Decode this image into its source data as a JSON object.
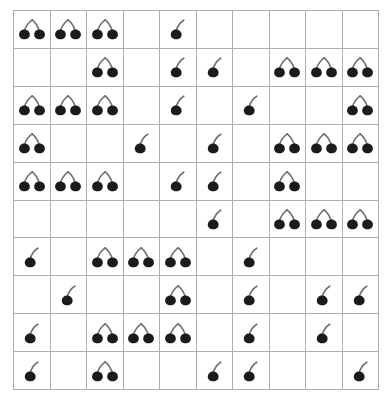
{
  "panel": {
    "name": "cherry-count-grid",
    "title": "Cherry Grid",
    "background_color": "#ffffff",
    "grid_line_color": "#aeaeae",
    "cherry_color": "#1b1b1b",
    "stem_color": "#6f6f6f"
  },
  "grid": {
    "rows": 10,
    "columns": 10,
    "cell_width_px": 36.6,
    "cell_height_px": 38,
    "icon_names": {
      "empty": "empty-cell",
      "single": "cherry-single-icon",
      "pair": "cherry-pair-icon"
    },
    "legend": {
      "0": "empty",
      "1": "single cherry",
      "2": "cherry pair"
    },
    "cells": [
      [
        2,
        2,
        2,
        0,
        1,
        0,
        0,
        0,
        0,
        0
      ],
      [
        0,
        0,
        2,
        0,
        1,
        1,
        0,
        2,
        2,
        2
      ],
      [
        2,
        2,
        2,
        0,
        1,
        0,
        1,
        0,
        0,
        2
      ],
      [
        2,
        0,
        0,
        1,
        0,
        1,
        0,
        2,
        2,
        2
      ],
      [
        2,
        2,
        2,
        0,
        1,
        1,
        0,
        2,
        0,
        0
      ],
      [
        0,
        0,
        0,
        0,
        0,
        1,
        0,
        2,
        2,
        2
      ],
      [
        1,
        0,
        2,
        2,
        2,
        0,
        1,
        0,
        0,
        0
      ],
      [
        0,
        1,
        0,
        0,
        2,
        0,
        1,
        0,
        1,
        1
      ],
      [
        1,
        0,
        2,
        2,
        2,
        0,
        1,
        0,
        1,
        0
      ],
      [
        1,
        0,
        2,
        0,
        0,
        1,
        1,
        0,
        0,
        1
      ]
    ],
    "row_totals": [
      7,
      8,
      9,
      8,
      8,
      7,
      7,
      5,
      8,
      5
    ],
    "column_totals": [
      9,
      6,
      12,
      5,
      10,
      6,
      5,
      8,
      7,
      8
    ],
    "total_cherries": 72
  }
}
